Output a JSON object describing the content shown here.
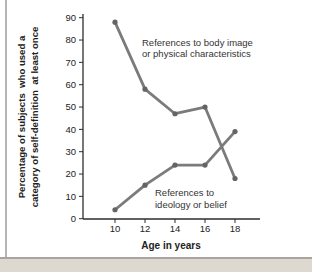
{
  "page": {
    "background": "#ffffff",
    "frame": {
      "left_line_color": "#b5b5b5",
      "bottom_line_color": "#a9a59e",
      "bottom_strip_color": "#ddd9d1"
    }
  },
  "chart_data": {
    "type": "line",
    "title": "",
    "xlabel": "Age in years",
    "ylabel_lines": [
      "Percentage of subjects  who used a",
      "category of self-definition  at least once"
    ],
    "x": [
      10,
      12,
      14,
      16,
      18
    ],
    "xtick_labels": [
      "10",
      "12",
      "14",
      "16",
      "18"
    ],
    "ytick_values": [
      0,
      10,
      20,
      30,
      40,
      50,
      60,
      70,
      80,
      90
    ],
    "ytick_labels": [
      "0",
      "10",
      "20",
      "30",
      "40",
      "50",
      "60",
      "70",
      "80",
      "90"
    ],
    "xlim": [
      8,
      19.7
    ],
    "ylim": [
      0,
      92
    ],
    "grid": false,
    "legend_position": "inline-annotations",
    "colors": {
      "line": "#7b7b7b",
      "point": "#646464",
      "axis": "#2d2d2d",
      "tick_text": "#222222",
      "annotation_text": "#333333"
    },
    "series": [
      {
        "name": "References to body image or physical characteristics",
        "x": [
          10,
          12,
          14,
          16,
          18
        ],
        "values": [
          88,
          58,
          47,
          50,
          18
        ]
      },
      {
        "name": "References to ideology or belief",
        "x": [
          10,
          12,
          14,
          16,
          18
        ],
        "values": [
          4,
          15,
          24,
          24,
          39
        ]
      }
    ],
    "annotations": [
      {
        "text_lines": [
          "References to body image",
          "or physical characteristics"
        ],
        "series_index": 0
      },
      {
        "text_lines": [
          "References to",
          "ideology or belief"
        ],
        "series_index": 1
      }
    ]
  }
}
